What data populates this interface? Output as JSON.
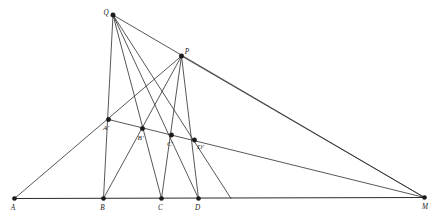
{
  "figure": {
    "type": "geometric-diagram",
    "width": 437,
    "height": 224,
    "background_color": "#ffffff",
    "line_color": "#2c2c2c",
    "vertex_color": "#1a1a1a",
    "label_color": "#1a1a1a"
  },
  "points": [
    {
      "id": "A",
      "label": "A",
      "x": 14.5,
      "y": 198.5,
      "label_dx": -1.5,
      "label_dy": 9.5,
      "anchor": "middle",
      "marker_r": 2.1
    },
    {
      "id": "B",
      "label": "B",
      "x": 103.5,
      "y": 198.5,
      "label_dx": -1.0,
      "label_dy": 9.5,
      "anchor": "middle",
      "marker_r": 2.1
    },
    {
      "id": "C",
      "label": "C",
      "x": 161.5,
      "y": 198.5,
      "label_dx": -1.0,
      "label_dy": 9.5,
      "anchor": "middle",
      "marker_r": 2.1
    },
    {
      "id": "D",
      "label": "D",
      "x": 198.5,
      "y": 198.5,
      "label_dx": -1.0,
      "label_dy": 9.5,
      "anchor": "middle",
      "marker_r": 2.1
    },
    {
      "id": "M",
      "label": "M",
      "x": 424.5,
      "y": 197.5,
      "label_dx": 0.5,
      "label_dy": 9.5,
      "anchor": "middle",
      "marker_r": 2.1
    },
    {
      "id": "Q",
      "label": "Q",
      "x": 113.0,
      "y": 15.0,
      "label_dx": -7.0,
      "label_dy": -2.0,
      "anchor": "middle",
      "marker_r": 2.3
    },
    {
      "id": "P",
      "label": "P",
      "x": 181.5,
      "y": 56.0,
      "label_dx": 5.5,
      "label_dy": -3.5,
      "anchor": "middle",
      "marker_r": 2.3
    },
    {
      "id": "Ap",
      "label": "A'",
      "x": 108.5,
      "y": 119.5,
      "label_dx": -2.5,
      "label_dy": 9.0,
      "anchor": "middle",
      "marker_r": 2.2
    },
    {
      "id": "Bp",
      "label": "B'",
      "x": 142.5,
      "y": 128.5,
      "label_dx": -2.0,
      "label_dy": 9.5,
      "anchor": "middle",
      "marker_r": 2.2
    },
    {
      "id": "Cp",
      "label": "C'",
      "x": 171.5,
      "y": 135.0,
      "label_dx": -1.5,
      "label_dy": 9.5,
      "anchor": "middle",
      "marker_r": 2.2
    },
    {
      "id": "Dp",
      "label": "D'",
      "x": 194.5,
      "y": 140.0,
      "label_dx": 6.0,
      "label_dy": 7.5,
      "anchor": "middle",
      "marker_r": 2.2
    }
  ],
  "segments": [
    {
      "name": "baseline-A-M",
      "from": "A",
      "to": "M",
      "style": "baseline"
    },
    {
      "name": "line-A-Ap-P",
      "from": "A",
      "to": "P",
      "style": "normal"
    },
    {
      "name": "line-Ap-Dp-M",
      "from": "Ap",
      "to": "M",
      "style": "normal"
    },
    {
      "name": "line-Q-B",
      "from": "Q",
      "to": "B",
      "style": "normal"
    },
    {
      "name": "line-Q-C",
      "from": "Q",
      "to": "C",
      "style": "normal"
    },
    {
      "name": "line-Q-D",
      "from": "Q",
      "to": "D",
      "style": "normal"
    },
    {
      "name": "line-Q-Dp-base",
      "from": "Q",
      "to": "X1",
      "style": "normal"
    },
    {
      "name": "line-Q-M",
      "from": "Q",
      "to": "M",
      "style": "normal"
    },
    {
      "name": "line-P-B",
      "from": "P",
      "to": "B",
      "style": "normal"
    },
    {
      "name": "line-P-C",
      "from": "P",
      "to": "C",
      "style": "normal"
    },
    {
      "name": "line-P-D",
      "from": "P",
      "to": "D",
      "style": "normal"
    },
    {
      "name": "line-P-M",
      "from": "P",
      "to": "M",
      "style": "normal"
    }
  ],
  "aux_points": [
    {
      "id": "X1",
      "x": 231.0,
      "y": 198.5
    }
  ],
  "labels_summary": [
    "A",
    "B",
    "C",
    "D",
    "M",
    "Q",
    "P",
    "A'",
    "B'",
    "C'",
    "D'"
  ]
}
